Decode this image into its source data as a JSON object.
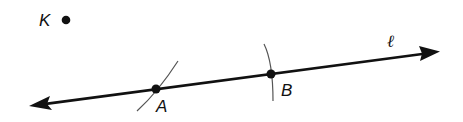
{
  "diagram": {
    "type": "geometry-construction",
    "colors": {
      "ink": "#111111",
      "arc": "#444444",
      "background": "#ffffff"
    },
    "line": {
      "label": "ℓ",
      "description": "line ℓ with arrows on both ends"
    },
    "points": [
      {
        "id": "K",
        "label": "K",
        "note": "point not on line ℓ"
      },
      {
        "id": "A",
        "label": "A",
        "note": "point on line ℓ, arc intersection"
      },
      {
        "id": "B",
        "label": "B",
        "note": "point on line ℓ, arc intersection"
      }
    ],
    "arcs": [
      {
        "through": "A"
      },
      {
        "through": "B"
      }
    ]
  }
}
